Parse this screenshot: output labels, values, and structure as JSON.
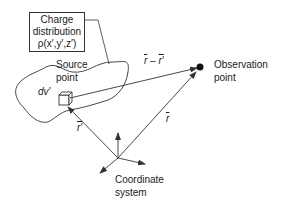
{
  "charge_box": {
    "line1": "Charge",
    "line2": "distribution",
    "line3": "ρ(x′,y′,z′)"
  },
  "source_label": {
    "line1": "Source",
    "line2": "point"
  },
  "volume_element": "dv′",
  "observation_label": {
    "line1": "Observation",
    "line2": "point"
  },
  "vector_r_minus_rprime": {
    "a": "r",
    "minus": " – ",
    "b": "r′"
  },
  "vector_r": "r",
  "vector_rprime": "r′",
  "coordinate_label": {
    "line1": "Coordinate",
    "line2": "system"
  },
  "colors": {
    "stroke": "#333333",
    "text": "#1a1a1a"
  }
}
